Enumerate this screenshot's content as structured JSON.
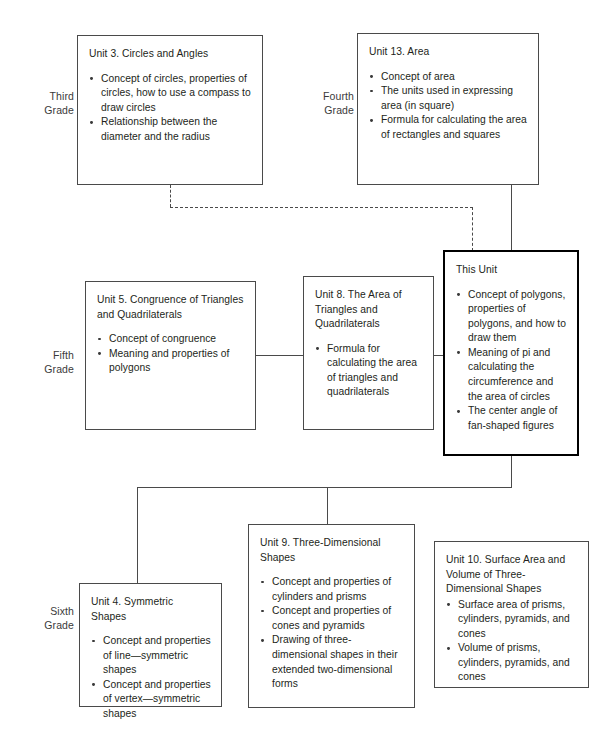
{
  "diagram": {
    "grades": [
      {
        "id": "third",
        "label": "Third\nGrade"
      },
      {
        "id": "fourth",
        "label": "Fourth\nGrade"
      },
      {
        "id": "fifth",
        "label": "Fifth\nGrade"
      },
      {
        "id": "sixth",
        "label": "Sixth\nGrade"
      }
    ],
    "units": {
      "unit3": {
        "title": "Unit 3. Circles and Angles",
        "bullets": [
          "Concept of circles, properties of circles, how to use a compass to draw circles",
          "Relationship between the diameter and the radius"
        ]
      },
      "unit13": {
        "title": "Unit 13. Area",
        "bullets": [
          "Concept of area",
          "The units used in expressing area (in square)",
          "Formula for calculating the area of rectangles and squares"
        ]
      },
      "unit5": {
        "title": "Unit 5. Congruence of Triangles and Quadrilaterals",
        "bullets": [
          "Concept of congruence",
          "Meaning and properties of polygons"
        ]
      },
      "unit8": {
        "title": "Unit 8. The Area of Triangles and Quadrilaterals",
        "bullets": [
          "Formula for calculating the area of triangles and quadrilaterals"
        ]
      },
      "thisunit": {
        "title": "This Unit",
        "bullets": [
          "Concept of polygons, properties of polygons, and how to draw them",
          "Meaning of pi and calculating the circumference and the area of circles",
          "The center angle of fan-shaped figures"
        ]
      },
      "unit4": {
        "title": "Unit 4. Symmetric Shapes",
        "bullets": [
          "Concept and properties of line—symmetric shapes",
          "Concept and properties of vertex—symmetric shapes"
        ]
      },
      "unit9": {
        "title": "Unit 9. Three-Dimensional Shapes",
        "bullets": [
          "Concept and properties of cylinders and prisms",
          "Concept and properties of cones and pyramids",
          "Drawing of three-dimensional shapes in their extended two-dimensional forms"
        ]
      },
      "unit10": {
        "title": "Unit 10. Surface Area and Volume of Three-Dimensional Shapes",
        "bullets": [
          "Surface area of prisms, cylinders, pyramids, and cones",
          "Volume of prisms, cylinders, pyramids, and cones"
        ]
      }
    },
    "colors": {
      "box_border": "#4a4a4a",
      "emphasis_border": "#000000",
      "text": "#231f20",
      "connector": "#4a4a4a",
      "background": "#ffffff"
    }
  }
}
